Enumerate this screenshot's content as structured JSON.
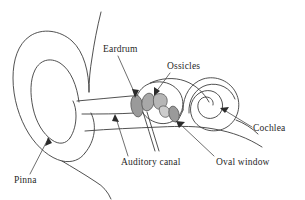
{
  "diagram": {
    "background_color": "#ffffff",
    "line_color": "#3d3d3d",
    "text_color": "#1f1f1f",
    "organ_fill_color": "#9a9a9a",
    "organ_fill_light": "#b6b6b6",
    "organ_fill_pale": "#d9d9d9"
  },
  "labels": {
    "eardrum": "Eardrum",
    "ossicles": "Ossicles",
    "cochlea": "Cochlea",
    "auditory_canal": "Auditory canal",
    "oval_window": "Oval window",
    "pinna": "Pinna"
  },
  "parts": [
    {
      "id": "pinna",
      "label": "Pinna",
      "label_x": 14,
      "label_y": 176
    },
    {
      "id": "eardrum",
      "label": "Eardrum",
      "label_x": 103,
      "label_y": 45
    },
    {
      "id": "ossicles",
      "label": "Ossicles",
      "label_x": 167,
      "label_y": 62
    },
    {
      "id": "auditory-canal",
      "label": "Auditory canal",
      "label_x": 121,
      "label_y": 158
    },
    {
      "id": "oval-window",
      "label": "Oval window",
      "label_x": 216,
      "label_y": 158
    },
    {
      "id": "cochlea",
      "label": "Cochlea",
      "label_x": 253,
      "label_y": 124
    }
  ]
}
